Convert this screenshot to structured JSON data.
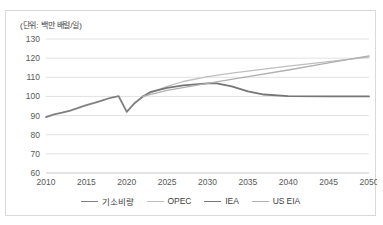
{
  "chart_data": {
    "type": "line",
    "title": "",
    "subtitle": "",
    "unit_note": "(단위: 백만 배럴/일)",
    "xlabel": "",
    "ylabel": "",
    "xlim": [
      2010,
      2050
    ],
    "ylim": [
      60,
      130
    ],
    "y_ticks": [
      60,
      70,
      80,
      90,
      100,
      110,
      120,
      130
    ],
    "x_ticks": [
      2010,
      2015,
      2020,
      2025,
      2030,
      2035,
      2040,
      2045,
      2050
    ],
    "grid": "horizontal",
    "legend_position": "bottom",
    "series": [
      {
        "name": "기소비량",
        "color": "#808080",
        "width": 1.8,
        "x": [
          2010,
          2011,
          2012,
          2013,
          2014,
          2015,
          2016,
          2017,
          2018,
          2019,
          2020,
          2021,
          2022
        ],
        "values": [
          89.2,
          90.6,
          91.5,
          92.6,
          94.0,
          95.5,
          96.6,
          97.9,
          99.3,
          100.1,
          91.9,
          96.6,
          100.0
        ]
      },
      {
        "name": "OPEC",
        "color": "#bfbfbf",
        "width": 1.3,
        "x": [
          2022,
          2023,
          2025,
          2027,
          2030,
          2033,
          2035,
          2040,
          2045,
          2050
        ],
        "values": [
          100.0,
          102.0,
          105.2,
          107.8,
          110.3,
          112.2,
          113.2,
          115.8,
          118.2,
          120.6
        ]
      },
      {
        "name": "IEA",
        "color": "#767676",
        "width": 1.8,
        "x": [
          2022,
          2023,
          2025,
          2027,
          2030,
          2031,
          2033,
          2035,
          2037,
          2040,
          2045,
          2050
        ],
        "values": [
          100.0,
          102.4,
          104.5,
          105.8,
          106.8,
          107.0,
          105.2,
          102.6,
          101.0,
          100.2,
          100.0,
          100.0
        ]
      },
      {
        "name": "US EIA",
        "color": "#b0b0b0",
        "width": 1.3,
        "x": [
          2022,
          2025,
          2030,
          2035,
          2040,
          2045,
          2050
        ],
        "values": [
          100.0,
          103.2,
          106.8,
          110.3,
          113.8,
          117.5,
          121.2
        ]
      }
    ]
  },
  "legend": {
    "items": [
      {
        "label": "기소비량",
        "color": "#808080",
        "width": "1.8px"
      },
      {
        "label": "OPEC",
        "color": "#bfbfbf",
        "width": "1.3px"
      },
      {
        "label": "IEA",
        "color": "#767676",
        "width": "1.8px"
      },
      {
        "label": "US EIA",
        "color": "#b0b0b0",
        "width": "1.3px"
      }
    ]
  }
}
